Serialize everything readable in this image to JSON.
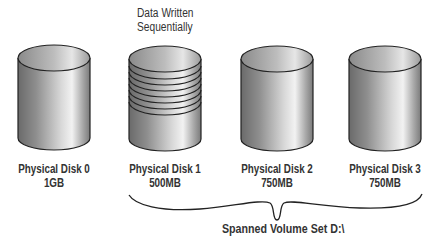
{
  "annotation": {
    "line1": "Data Written",
    "line2": "Sequentially"
  },
  "disks": [
    {
      "name": "Physical Disk 0",
      "size": "1GB",
      "striped": false
    },
    {
      "name": "Physical Disk 1",
      "size": "500MB",
      "striped": true
    },
    {
      "name": "Physical Disk 2",
      "size": "750MB",
      "striped": false
    },
    {
      "name": "Physical Disk 3",
      "size": "750MB",
      "striped": false
    }
  ],
  "brace": {
    "label": "Spanned Volume Set D:\\",
    "spans": [
      "Physical Disk 1",
      "Physical Disk 2",
      "Physical Disk 3"
    ]
  },
  "colors": {
    "outline": "#222222",
    "text": "#333333",
    "cyl_dark": "#6a6a6a",
    "cyl_light": "#f2f2f2"
  }
}
